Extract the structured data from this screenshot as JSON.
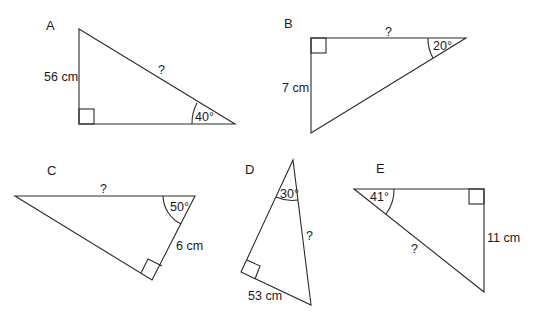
{
  "diagram": {
    "colors": {
      "stroke": "#2a2a2a",
      "text": "#1a1a1a",
      "background": "#ffffff"
    },
    "triangles": [
      {
        "id": "A",
        "label": "A",
        "known_side": "56 cm",
        "unknown": "?",
        "angle": "40°"
      },
      {
        "id": "B",
        "label": "B",
        "known_side": "7 cm",
        "unknown": "?",
        "angle": "20°"
      },
      {
        "id": "C",
        "label": "C",
        "known_side": "6 cm",
        "unknown": "?",
        "angle": "50°"
      },
      {
        "id": "D",
        "label": "D",
        "known_side": "53 cm",
        "unknown": "?",
        "angle": "30°"
      },
      {
        "id": "E",
        "label": "E",
        "known_side": "11 cm",
        "unknown": "?",
        "angle": "41°"
      }
    ]
  }
}
